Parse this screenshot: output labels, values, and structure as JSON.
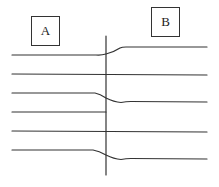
{
  "diagram": {
    "labels": {
      "left_region": "A",
      "right_region": "B"
    },
    "colors": {
      "stroke": "#333333",
      "background": "#ffffff"
    },
    "boundary": {
      "description": "vertical boundary line",
      "x": 106,
      "y_top": 36,
      "y_bottom": 175
    },
    "lines": [
      {
        "id": 1,
        "left_y": 55,
        "right_y": 47,
        "shape": "bends-up",
        "crosses_boundary": true
      },
      {
        "id": 2,
        "left_y": 74,
        "right_y": 75,
        "shape": "straight",
        "crosses_boundary": true
      },
      {
        "id": 3,
        "left_y": 93,
        "right_y": 102,
        "shape": "bends-down",
        "crosses_boundary": true
      },
      {
        "id": 4,
        "left_y": 112,
        "right_y": null,
        "shape": "terminates-at-boundary",
        "crosses_boundary": false
      },
      {
        "id": 5,
        "left_y": 131,
        "right_y": 132,
        "shape": "straight",
        "crosses_boundary": true
      },
      {
        "id": 6,
        "left_y": 150,
        "right_y": 159,
        "shape": "bends-down",
        "crosses_boundary": true
      }
    ]
  }
}
